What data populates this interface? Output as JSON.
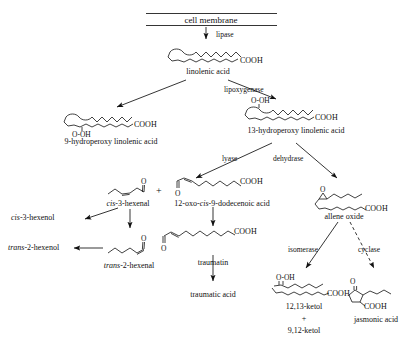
{
  "diagram": {
    "type": "biochemical-pathway",
    "membrane_label": "cell membrane",
    "nodes": {
      "linolenic_acid": "linolenic acid",
      "hydroperoxy_9": "9-hydroperoxy linolenic acid",
      "hydroperoxy_13": "13-hydroperoxy linolenic acid",
      "cis3hexenal": "cis-3-hexenal",
      "cis3hexenal_prefix": "cis",
      "cis3hexenal_rest": "-3-hexenal",
      "dodecenoic": "12-oxo-cis-9-dodecenoic acid",
      "dodecenoic_pre": "12-oxo-",
      "dodecenoic_it": "cis",
      "dodecenoic_post": "-9-dodecenoic acid",
      "cis3hexenol_prefix": "cis",
      "cis3hexenol_rest": "-3-hexenol",
      "trans2hexenal_prefix": "trans",
      "trans2hexenal_rest": "-2-hexenal",
      "trans2hexenol_prefix": "trans",
      "trans2hexenol_rest": "-2-hexenol",
      "traumatin": "traumatin",
      "traumatic_acid": "traumatic acid",
      "allene_oxide": "allene oxide",
      "ketol_1": "12,13-ketol",
      "ketol_plus": "+",
      "ketol_2": "9,12-ketol",
      "jasmonic_acid": "jasmonic acid",
      "plus_sign": "+"
    },
    "enzymes": {
      "lipase": "lipase",
      "lipoxygenase": "lipoxygenase",
      "lyase": "lyase",
      "dehydrase": "dehydrase",
      "isomerase": "isomerase",
      "cyclase": "cyclase"
    },
    "chem_groups": {
      "cooh": "COOH",
      "o_oh": "O-OH",
      "o": "O"
    },
    "colors": {
      "ink": "#111111",
      "background": "#ffffff"
    }
  }
}
